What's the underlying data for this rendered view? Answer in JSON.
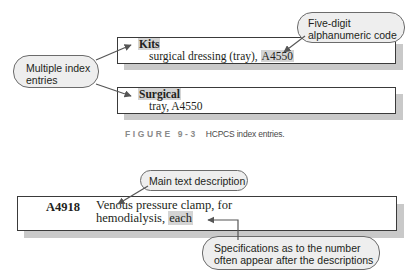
{
  "figure_top": {
    "entries": [
      {
        "heading": "Kits",
        "line_prefix": "surgical dressing (tray), ",
        "code": "A4550"
      },
      {
        "heading": "Surgical",
        "line_prefix": "tray, ",
        "code": "A4550"
      }
    ],
    "callout_left": {
      "line1": "Multiple index",
      "line2": "entries"
    },
    "callout_right": {
      "line1": "Five-digit",
      "line2": "alphanumeric code"
    },
    "caption": {
      "label": "FIGURE 9-3",
      "text": "HCPCS index entries."
    }
  },
  "figure_bottom": {
    "code": "A4918",
    "description_line1": "Venous pressure clamp, for",
    "description_line2_prefix": "hemodialysis, ",
    "description_unit": "each",
    "callout_top": {
      "text": "Main text description"
    },
    "callout_bottom": {
      "line1": "Specifications as to the number",
      "line2": "often appear after the descriptions"
    }
  },
  "colors": {
    "highlight": "#d4d4d4",
    "shadow": "#c9c9c9",
    "bubble_fill": "#eeeeee",
    "caption_label": "#8a8a8a",
    "arrow": "#555555"
  }
}
